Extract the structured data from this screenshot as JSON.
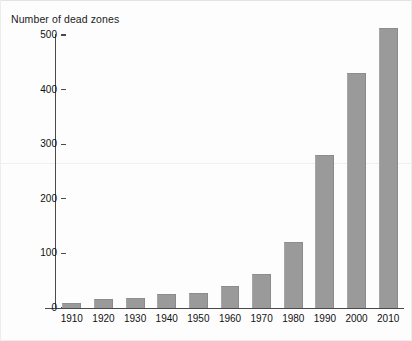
{
  "chart_data": {
    "type": "bar",
    "title": "",
    "ylabel": "Number of dead zones",
    "xlabel": "",
    "categories": [
      "1910",
      "1920",
      "1930",
      "1940",
      "1950",
      "1960",
      "1970",
      "1980",
      "1990",
      "2000",
      "2010"
    ],
    "values": [
      10,
      17,
      19,
      26,
      28,
      40,
      62,
      120,
      280,
      430,
      512
    ],
    "ylim": [
      0,
      500
    ],
    "ytick_labels": [
      "0",
      "100",
      "200",
      "300",
      "400",
      "500"
    ],
    "ytick_values": [
      0,
      100,
      200,
      300,
      400,
      500
    ],
    "grid": false,
    "legend": null,
    "series": [
      {
        "name": "Number of dead zones",
        "values": [
          10,
          17,
          19,
          26,
          28,
          40,
          62,
          120,
          280,
          430,
          512
        ]
      }
    ],
    "bar_color": "#9a9a9a",
    "axis_color": "#4a4a4a",
    "background_color": "#fdfdfd"
  }
}
